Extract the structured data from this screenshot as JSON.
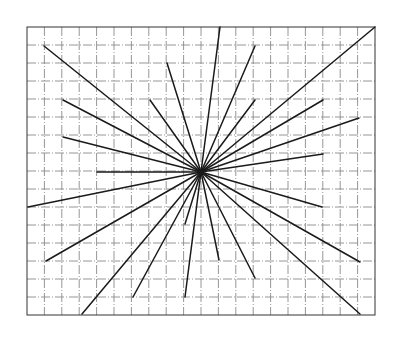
{
  "diagram": {
    "type": "radial-starburst-on-grid",
    "background": "#ffffff",
    "grid": {
      "x0": 27,
      "y0": 27,
      "x1": 375,
      "y1": 315,
      "columns": 20,
      "rows": 16,
      "color": "#8a8a8a",
      "border_color": "#333333"
    },
    "center": {
      "x": 201,
      "y": 172
    },
    "ray_color": "#1a1a1a",
    "rays": [
      {
        "x": 220,
        "y": 27
      },
      {
        "x": 255,
        "y": 46
      },
      {
        "x": 255,
        "y": 100
      },
      {
        "x": 375,
        "y": 27
      },
      {
        "x": 323,
        "y": 100
      },
      {
        "x": 359,
        "y": 118
      },
      {
        "x": 323,
        "y": 154
      },
      {
        "x": 322,
        "y": 207
      },
      {
        "x": 360,
        "y": 262
      },
      {
        "x": 360,
        "y": 314
      },
      {
        "x": 255,
        "y": 278
      },
      {
        "x": 219,
        "y": 260
      },
      {
        "x": 185,
        "y": 297
      },
      {
        "x": 185,
        "y": 224
      },
      {
        "x": 133,
        "y": 297
      },
      {
        "x": 82,
        "y": 314
      },
      {
        "x": 46,
        "y": 261
      },
      {
        "x": 28,
        "y": 207
      },
      {
        "x": 97,
        "y": 172
      },
      {
        "x": 63,
        "y": 137
      },
      {
        "x": 63,
        "y": 100
      },
      {
        "x": 44,
        "y": 46
      },
      {
        "x": 150,
        "y": 100
      },
      {
        "x": 167,
        "y": 63
      }
    ]
  }
}
